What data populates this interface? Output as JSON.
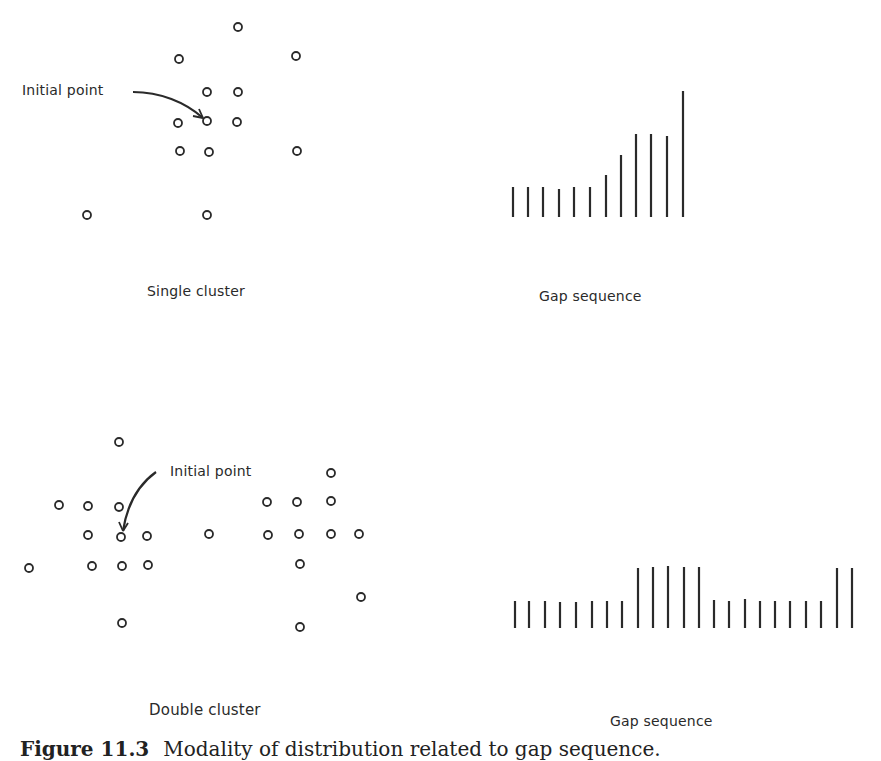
{
  "figure": {
    "caption_number": "Figure 11.3",
    "caption_text": "Modality of distribution related to gap sequence.",
    "ink_color": "#2a2a2a"
  },
  "panels": {
    "single": {
      "scatter_label": "Single cluster",
      "gap_label": "Gap sequence",
      "annotation": "Initial point"
    },
    "double": {
      "scatter_label": "Double cluster",
      "gap_label": "Gap sequence",
      "annotation": "Initial point"
    }
  },
  "chart_data": [
    {
      "type": "scatter",
      "title": "Single cluster",
      "annotation": {
        "text": "Initial point",
        "target": [
          207,
          121
        ]
      },
      "points": [
        [
          238,
          27
        ],
        [
          179,
          59
        ],
        [
          296,
          56
        ],
        [
          207,
          92
        ],
        [
          238,
          92
        ],
        [
          178,
          123
        ],
        [
          207,
          121
        ],
        [
          237,
          122
        ],
        [
          180,
          151
        ],
        [
          209,
          152
        ],
        [
          297,
          151
        ],
        [
          87,
          215
        ],
        [
          207,
          215
        ]
      ]
    },
    {
      "type": "bar",
      "title": "Gap sequence",
      "baseline_y": 217,
      "x": [
        513,
        528,
        543,
        559,
        574,
        590,
        606,
        621,
        636,
        651,
        667,
        683
      ],
      "values": [
        30,
        30,
        30,
        28,
        30,
        30,
        42,
        62,
        83,
        83,
        81,
        126
      ]
    },
    {
      "type": "scatter",
      "title": "Double cluster",
      "annotation": {
        "text": "Initial point",
        "target": [
          121,
          537
        ]
      },
      "points": [
        [
          119,
          442
        ],
        [
          59,
          505
        ],
        [
          88,
          506
        ],
        [
          119,
          507
        ],
        [
          88,
          535
        ],
        [
          121,
          537
        ],
        [
          147,
          536
        ],
        [
          209,
          534
        ],
        [
          29,
          568
        ],
        [
          92,
          566
        ],
        [
          122,
          566
        ],
        [
          148,
          565
        ],
        [
          122,
          623
        ],
        [
          331,
          473
        ],
        [
          267,
          502
        ],
        [
          297,
          502
        ],
        [
          331,
          501
        ],
        [
          268,
          535
        ],
        [
          299,
          534
        ],
        [
          331,
          534
        ],
        [
          359,
          534
        ],
        [
          300,
          564
        ],
        [
          361,
          597
        ],
        [
          300,
          627
        ]
      ]
    },
    {
      "type": "bar",
      "title": "Gap sequence",
      "baseline_y": 628,
      "x": [
        515,
        529,
        545,
        560,
        576,
        592,
        607,
        622,
        638,
        653,
        668,
        684,
        699,
        714,
        729,
        745,
        760,
        775,
        790,
        806,
        821,
        837,
        852
      ],
      "values": [
        27,
        27,
        27,
        26,
        26,
        27,
        27,
        27,
        60,
        61,
        62,
        61,
        61,
        28,
        27,
        29,
        27,
        27,
        27,
        27,
        27,
        60,
        60
      ]
    }
  ]
}
